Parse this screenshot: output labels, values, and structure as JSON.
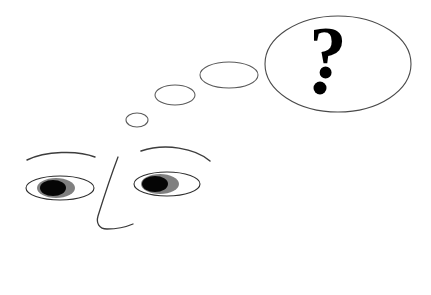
{
  "scene": {
    "title": "Thinking face with question mark thought bubble",
    "width": 431,
    "height": 295,
    "background_color": "#ffffff"
  },
  "thought_bubble": {
    "label": "thought-bubble-large",
    "symbol": "?",
    "symbol_dot": "·",
    "outline_color": "#4a4a4a",
    "fill_color": "#ffffff",
    "symbol_color": "#000000",
    "center_x": 338,
    "center_y": 64,
    "radius_x": 73,
    "radius_y": 48
  },
  "trail_bubbles": [
    {
      "label": "thought-bubble-trail-large",
      "center_x": 229,
      "center_y": 75,
      "radius_x": 29,
      "radius_y": 13
    },
    {
      "label": "thought-bubble-trail-medium",
      "center_x": 175,
      "center_y": 95,
      "radius_x": 20,
      "radius_y": 10
    },
    {
      "label": "thought-bubble-trail-small",
      "center_x": 137,
      "center_y": 120,
      "radius_x": 11,
      "radius_y": 7
    }
  ],
  "face": {
    "label": "face",
    "left_eye": {
      "label": "left-eye",
      "center_x": 60,
      "center_y": 188,
      "radius_x": 34,
      "radius_y": 12,
      "iris_center_x": 56,
      "iris_radius_x": 19,
      "iris_radius_y": 10,
      "pupil_center_x": 53,
      "pupil_radius_x": 13,
      "pupil_radius_y": 8,
      "iris_color": "#808080",
      "pupil_color": "#050505",
      "white_color": "#ffffff"
    },
    "right_eye": {
      "label": "right-eye",
      "center_x": 167,
      "center_y": 184,
      "radius_x": 33,
      "radius_y": 12,
      "iris_center_x": 160,
      "iris_radius_x": 19,
      "iris_radius_y": 10,
      "pupil_center_x": 155,
      "pupil_radius_x": 13,
      "pupil_radius_y": 8,
      "iris_color": "#808080",
      "pupil_color": "#050505",
      "white_color": "#ffffff"
    },
    "left_eyebrow": {
      "label": "left-eyebrow",
      "path": "M27,160 C45,151 78,150 95,157"
    },
    "right_eyebrow": {
      "label": "right-eyebrow",
      "path": "M141,151 C165,143 195,148 210,161"
    },
    "nose": {
      "label": "nose",
      "path": "M118,157 C110,178 103,200 98,216 C96,223 99,229 107,229 C116,229 126,227 133,224"
    }
  }
}
